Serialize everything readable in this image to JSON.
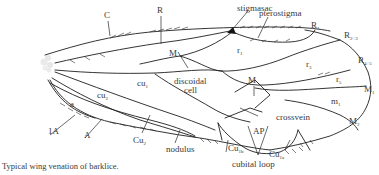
{
  "figure": {
    "caption": "Typical wing venation of barklice.",
    "labels": {
      "C": "C",
      "R": "R",
      "stigmasac": "stigmasac",
      "pterostigma": "pterostigma",
      "R1": "R",
      "R1_sub": "1",
      "R23": "R",
      "R23_sub": "2+3",
      "R45": "R",
      "R45_sub": "4+5",
      "r1": "r",
      "r1_sub": "1",
      "r3": "r",
      "r3_sub": "3",
      "r5": "r",
      "r5_sub": "5",
      "M_upper": "M",
      "M_lower": "M",
      "discoidal": "discoidal",
      "cell": "cell",
      "M1": "M",
      "M1_sub": "1",
      "m1": "m",
      "m1_sub": "1",
      "M2": "M",
      "M2_sub": "2",
      "crossvein": "crossvein",
      "AP": "AP",
      "cu1": "cu",
      "cu1_sub": "1",
      "cu2": "cu",
      "cu2_sub": "2",
      "a": "a",
      "1A": "1A",
      "A": "A",
      "Cu2": "Cu",
      "Cu2_sub": "2",
      "nodulus": "nodulus",
      "Cu1b": "Cu",
      "Cu1b_sub": "1b",
      "Cu1a": "Cu",
      "Cu1a_sub": "1a",
      "cubital_loop": "cubital loop"
    },
    "colors": {
      "vein": "#1e1e1e",
      "text": "#3a3a3a",
      "background": "#ffffff"
    }
  }
}
